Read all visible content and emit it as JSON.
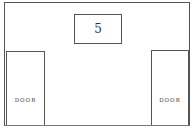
{
  "room": {
    "sign": {
      "number": "5"
    },
    "doors": [
      {
        "label": "DOOR",
        "position": "left"
      },
      {
        "label": "DOOR",
        "position": "right"
      }
    ]
  }
}
